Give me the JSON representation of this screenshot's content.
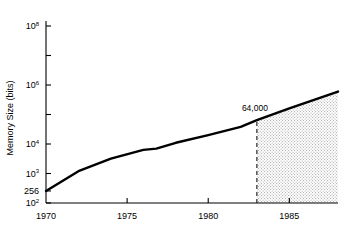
{
  "chart_data": {
    "type": "line",
    "title": "",
    "xlabel": "",
    "ylabel": "Memory Size (bits)",
    "xlim": [
      1970,
      1988
    ],
    "ylim": [
      100,
      100000000
    ],
    "yscale": "log",
    "grid": false,
    "legend": null,
    "xticks": [
      1970,
      1975,
      1980,
      1985
    ],
    "xtick_labels": [
      "1970",
      "1975",
      "1980",
      "1985"
    ],
    "yticks": [
      100,
      1000,
      10000,
      1000000,
      100000000
    ],
    "ytick_labels": [
      "10",
      "10",
      "10",
      "10",
      "10"
    ],
    "ytick_exponents": [
      "2",
      "3",
      "4",
      "6",
      "8"
    ],
    "ytick_minor": [
      100000,
      10000000
    ],
    "special_ytick": {
      "value": 256,
      "label": "256"
    },
    "series": [
      {
        "name": "Memory Size",
        "x": [
          1970,
          1972,
          1974,
          1976,
          1976.8,
          1978,
          1980,
          1982,
          1983,
          1985,
          1988
        ],
        "y": [
          256,
          1200,
          3200,
          6300,
          7000,
          11000,
          20000,
          38000,
          64000,
          160000,
          600000
        ]
      }
    ],
    "annotations": [
      {
        "text": "64,000",
        "x": 1983,
        "y": 64000,
        "type": "value-label"
      }
    ],
    "vline": {
      "x": 1983,
      "style": "dashed",
      "from_y": 100,
      "to_y": 64000
    },
    "shaded_region": {
      "x_start": 1983,
      "x_end": 1988,
      "style": "hatched",
      "description": "projection region"
    }
  },
  "colors": {
    "line": "#000000",
    "axis": "#000000",
    "shade_fill": "#e8e8e8",
    "background": "#ffffff"
  }
}
